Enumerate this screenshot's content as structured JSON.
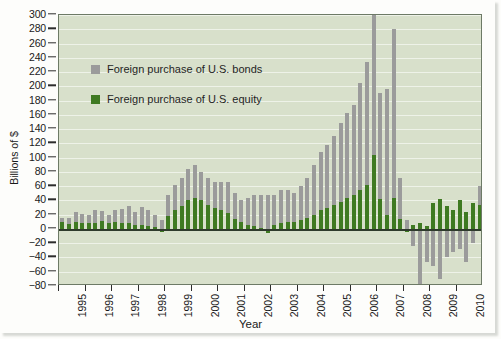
{
  "chart_data": {
    "type": "bar",
    "title": "",
    "subtitle": "",
    "xlabel": "Year",
    "ylabel": "Billions of $",
    "stacked": true,
    "grid": true,
    "legend_position": "upper-left-inside",
    "ylim": [
      -80,
      300
    ],
    "ytick_step": 20,
    "ytick_labels": [
      "300",
      "280",
      "260",
      "240",
      "220",
      "200",
      "180",
      "160",
      "140",
      "120",
      "100",
      "80",
      "60",
      "40",
      "20",
      "0",
      "−20",
      "−40",
      "−60",
      "−80"
    ],
    "ytick_values": [
      300,
      280,
      260,
      240,
      220,
      200,
      180,
      160,
      140,
      120,
      100,
      80,
      60,
      40,
      20,
      0,
      -20,
      -40,
      -60,
      -80
    ],
    "xtick_labels": [
      "1995",
      "1996",
      "1997",
      "1998",
      "1999",
      "2000",
      "2001",
      "2002",
      "2003",
      "2004",
      "2005",
      "2006",
      "2007",
      "2008",
      "2009",
      "2010"
    ],
    "x_period": "quarterly",
    "series": [
      {
        "name": "Foreign purchase of U.S. bonds",
        "color": "#9b9b9b",
        "values": [
          6,
          9,
          14,
          13,
          12,
          17,
          14,
          12,
          16,
          20,
          23,
          18,
          25,
          22,
          17,
          12,
          30,
          36,
          40,
          44,
          46,
          40,
          38,
          36,
          40,
          44,
          36,
          30,
          38,
          44,
          46,
          48,
          42,
          46,
          44,
          40,
          48,
          56,
          70,
          82,
          88,
          96,
          110,
          118,
          126,
          150,
          172,
          196,
          148,
          176,
          236,
          58,
          12,
          -24,
          -86,
          -46,
          -52,
          -70,
          -40,
          -32,
          -28,
          -46,
          -20,
          26
        ]
      },
      {
        "name": "Foreign purchase of U.S. equity",
        "color": "#3f7a22",
        "values": [
          10,
          7,
          10,
          8,
          8,
          9,
          11,
          8,
          10,
          8,
          9,
          6,
          6,
          4,
          3,
          -4,
          18,
          26,
          32,
          40,
          44,
          40,
          34,
          30,
          26,
          22,
          14,
          10,
          6,
          4,
          2,
          -5,
          6,
          8,
          10,
          10,
          12,
          16,
          20,
          26,
          30,
          34,
          38,
          44,
          48,
          54,
          62,
          104,
          42,
          20,
          44,
          14,
          -4,
          6,
          8,
          4,
          36,
          42,
          32,
          26,
          40,
          24,
          36,
          34
        ]
      }
    ]
  },
  "legend": {
    "items": [
      {
        "label": "Foreign purchase of U.S. bonds",
        "color": "#9b9b9b"
      },
      {
        "label": "Foreign purchase of U.S. equity",
        "color": "#3f7a22"
      }
    ]
  }
}
